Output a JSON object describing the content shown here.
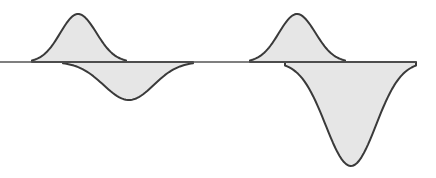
{
  "diagram": {
    "title": "",
    "colors": {
      "fill": "#e6e6e6",
      "stroke": "#3a3a3a",
      "baseline": "#555555",
      "background": "#ffffff"
    },
    "baseline_y": 62,
    "baseline_x_range": [
      0,
      416
    ],
    "groups": [
      {
        "name": "left-pair",
        "positive_lobe": {
          "x_start": 32,
          "x_end": 126,
          "peak_x": 78,
          "peak_y": 14
        },
        "negative_lobe": {
          "x_start": 63,
          "x_end": 193,
          "trough_x": 129,
          "trough_y": 100
        }
      },
      {
        "name": "right-pair",
        "positive_lobe": {
          "x_start": 250,
          "x_end": 345,
          "peak_x": 297,
          "peak_y": 14
        },
        "negative_lobe": {
          "x_start": 285,
          "x_end": 416,
          "trough_x": 351,
          "trough_y": 166
        }
      }
    ]
  }
}
